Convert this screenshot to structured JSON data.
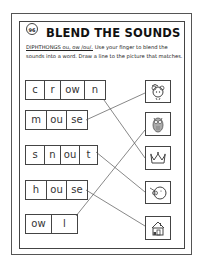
{
  "worksheet": {
    "page_number": "96",
    "title": "BLEND THE SOUNDS",
    "instruction_label": "DIPHTHONGS ou, ow /ou/.",
    "instruction_text": " Use your finger to blend the sounds into a word. Draw a line to the picture that matches."
  },
  "words": [
    {
      "word": "crown",
      "segments": [
        "c",
        "r",
        "ow",
        "n"
      ]
    },
    {
      "word": "mouse",
      "segments": [
        "m",
        "ou",
        "se"
      ]
    },
    {
      "word": "snout",
      "segments": [
        "s",
        "n",
        "ou",
        "t"
      ]
    },
    {
      "word": "house",
      "segments": [
        "h",
        "ou",
        "se"
      ]
    },
    {
      "word": "owl",
      "segments": [
        "ow",
        "l"
      ]
    }
  ],
  "pictures": [
    {
      "name": "mouse",
      "icon": "mouse-icon"
    },
    {
      "name": "owl",
      "icon": "owl-icon"
    },
    {
      "name": "crown",
      "icon": "crown-icon"
    },
    {
      "name": "pig-snout",
      "icon": "pig-icon"
    },
    {
      "name": "house",
      "icon": "house-icon"
    }
  ],
  "matches": [
    {
      "word": "crown",
      "picture": "crown"
    },
    {
      "word": "mouse",
      "picture": "mouse"
    },
    {
      "word": "snout",
      "picture": "pig-snout"
    },
    {
      "word": "house",
      "picture": "house"
    },
    {
      "word": "owl",
      "picture": "owl"
    }
  ],
  "colors": {
    "line": "#555555",
    "border": "#444444",
    "text": "#222222"
  }
}
